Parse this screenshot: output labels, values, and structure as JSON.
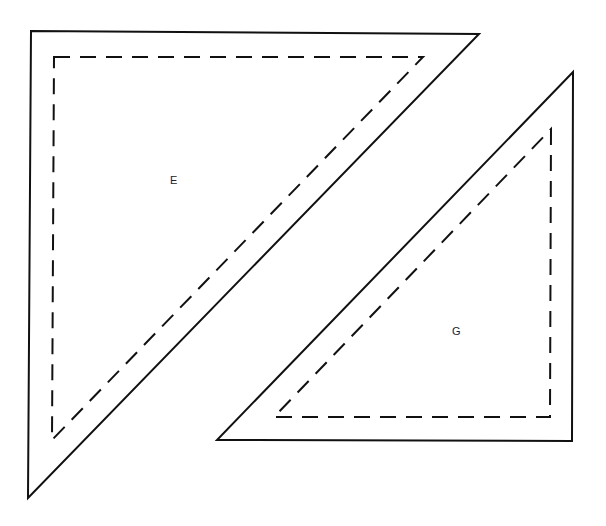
{
  "diagram": {
    "type": "quilt-pattern-pieces",
    "colors": {
      "line": "#111111",
      "background": "#ffffff",
      "text": "#222222"
    },
    "pieces": [
      {
        "label": "E",
        "label_pos": [
          174,
          184
        ],
        "outline": "31,31 479,34 28,498",
        "seam": "54,57 423,57 52,440"
      },
      {
        "label": "G",
        "label_pos": [
          456,
          334
        ],
        "outline": "573,72 572,441 217,440",
        "seam": "551,129 550,417 274,417"
      }
    ]
  }
}
